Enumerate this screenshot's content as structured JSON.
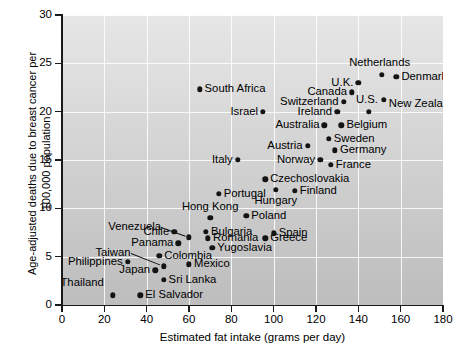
{
  "figure": {
    "axes": {
      "xlabel": "Estimated fat intake (grams per day)",
      "ylabel": "Age-adjusted deaths due to breast cancer per 100,000 population",
      "xticks": [
        "0",
        "20",
        "40",
        "60",
        "80",
        "100",
        "120",
        "140",
        "160",
        "180"
      ],
      "yticks": [
        "0",
        "5",
        "10",
        "15",
        "20",
        "25",
        "30"
      ]
    }
  },
  "chart_data": {
    "type": "scatter",
    "title": "",
    "xlabel": "Estimated fat intake (grams per day)",
    "ylabel": "Age-adjusted deaths due to breast cancer per 100,000 population",
    "xlim": [
      0,
      180
    ],
    "ylim": [
      0,
      30
    ],
    "xtick_step": 20,
    "ytick_step": 5,
    "grid": "white gridlines on both axes",
    "legend": "none",
    "point_count": 39,
    "points": [
      {
        "label": "Thailand",
        "x": 24,
        "y": 1.0,
        "lpos": "r",
        "ldx": -9,
        "ldy": -12
      },
      {
        "label": "El Salvador",
        "x": 37,
        "y": 1.0,
        "lpos": "l",
        "ldx": 5,
        "ldy": 0
      },
      {
        "label": "Philippines",
        "x": 31,
        "y": 4.5,
        "lpos": "r",
        "ldx": -5,
        "ldy": 0
      },
      {
        "label": "Japan",
        "x": 44,
        "y": 3.6,
        "lpos": "r",
        "ldx": -5,
        "ldy": 0
      },
      {
        "label": "Taiwan",
        "x": 48,
        "y": 4.0,
        "lpos": "r",
        "ldx": -33,
        "ldy": -13,
        "leader": true
      },
      {
        "label": "Sri Lanka",
        "x": 48,
        "y": 2.6,
        "lpos": "l",
        "ldx": 5,
        "ldy": 0
      },
      {
        "label": "Colombia",
        "x": 46,
        "y": 5.1,
        "lpos": "l",
        "ldx": 5,
        "ldy": 0
      },
      {
        "label": "Mexico",
        "x": 60,
        "y": 4.2,
        "lpos": "l",
        "ldx": 5,
        "ldy": 0
      },
      {
        "label": "Panama",
        "x": 55,
        "y": 6.4,
        "lpos": "r",
        "ldx": -5,
        "ldy": 0
      },
      {
        "label": "Chile",
        "x": 53,
        "y": 7.6,
        "lpos": "r",
        "ldx": -5,
        "ldy": 0
      },
      {
        "label": "Venezuela",
        "x": 60,
        "y": 7.0,
        "lpos": "r",
        "ldx": -28,
        "ldy": -10,
        "leader": true
      },
      {
        "label": "Hong Kong",
        "x": 70,
        "y": 9.0,
        "lpos": "c",
        "ldx": 0,
        "ldy": -11
      },
      {
        "label": "Portugal",
        "x": 74,
        "y": 11.5,
        "lpos": "l",
        "ldx": 5,
        "ldy": 0
      },
      {
        "label": "Bulgaria",
        "x": 68,
        "y": 7.6,
        "lpos": "l",
        "ldx": 5,
        "ldy": 0
      },
      {
        "label": "Romania",
        "x": 69,
        "y": 6.9,
        "lpos": "l",
        "ldx": 5,
        "ldy": 0
      },
      {
        "label": "Yugoslavia",
        "x": 71,
        "y": 5.9,
        "lpos": "l",
        "ldx": 5,
        "ldy": 0
      },
      {
        "label": "Poland",
        "x": 87,
        "y": 9.2,
        "lpos": "l",
        "ldx": 5,
        "ldy": 0
      },
      {
        "label": "Greece",
        "x": 96,
        "y": 6.9,
        "lpos": "l",
        "ldx": 5,
        "ldy": 0
      },
      {
        "label": "Spain",
        "x": 100,
        "y": 7.4,
        "lpos": "l",
        "ldx": 5,
        "ldy": 0
      },
      {
        "label": "Italy",
        "x": 83,
        "y": 15.0,
        "lpos": "r",
        "ldx": -5,
        "ldy": 0
      },
      {
        "label": "Czechoslovakia",
        "x": 96,
        "y": 13.0,
        "lpos": "l",
        "ldx": 5,
        "ldy": 0
      },
      {
        "label": "Hungary",
        "x": 101,
        "y": 11.9,
        "lpos": "c",
        "ldx": 0,
        "ldy": 11
      },
      {
        "label": "Finland",
        "x": 110,
        "y": 11.8,
        "lpos": "l",
        "ldx": 5,
        "ldy": 0
      },
      {
        "label": "Israel",
        "x": 95,
        "y": 20.0,
        "lpos": "r",
        "ldx": -5,
        "ldy": 0
      },
      {
        "label": "South Africa",
        "x": 65,
        "y": 22.3,
        "lpos": "l",
        "ldx": 5,
        "ldy": 0
      },
      {
        "label": "Austria",
        "x": 116,
        "y": 16.5,
        "lpos": "r",
        "ldx": -5,
        "ldy": 0
      },
      {
        "label": "Norway",
        "x": 122,
        "y": 15.0,
        "lpos": "r",
        "ldx": -5,
        "ldy": 0
      },
      {
        "label": "France",
        "x": 127,
        "y": 14.5,
        "lpos": "l",
        "ldx": 5,
        "ldy": 0
      },
      {
        "label": "Germany",
        "x": 129,
        "y": 16.0,
        "lpos": "l",
        "ldx": 5,
        "ldy": 0
      },
      {
        "label": "Sweden",
        "x": 126,
        "y": 17.2,
        "lpos": "l",
        "ldx": 5,
        "ldy": 0
      },
      {
        "label": "Australia",
        "x": 124,
        "y": 18.6,
        "lpos": "r",
        "ldx": -5,
        "ldy": 0
      },
      {
        "label": "Belgium",
        "x": 132,
        "y": 18.6,
        "lpos": "l",
        "ldx": 5,
        "ldy": 0
      },
      {
        "label": "Ireland",
        "x": 130,
        "y": 20.0,
        "lpos": "r",
        "ldx": -5,
        "ldy": 0
      },
      {
        "label": "U.S.",
        "x": 145,
        "y": 20.0,
        "lpos": "c",
        "ldx": -2,
        "ldy": -12
      },
      {
        "label": "Switzerland",
        "x": 133,
        "y": 21.0,
        "lpos": "r",
        "ldx": -5,
        "ldy": 0
      },
      {
        "label": "Canada",
        "x": 137,
        "y": 22.0,
        "lpos": "r",
        "ldx": -5,
        "ldy": 0
      },
      {
        "label": "U.K.",
        "x": 140,
        "y": 23.0,
        "lpos": "r",
        "ldx": -5,
        "ldy": 0
      },
      {
        "label": "New Zealand",
        "x": 152,
        "y": 21.2,
        "lpos": "l",
        "ldx": 5,
        "ldy": 4
      },
      {
        "label": "Netherlands",
        "x": 151,
        "y": 23.8,
        "lpos": "c",
        "ldx": -2,
        "ldy": -12
      },
      {
        "label": "Denmark",
        "x": 158,
        "y": 23.6,
        "lpos": "l",
        "ldx": 5,
        "ldy": 0
      }
    ]
  }
}
